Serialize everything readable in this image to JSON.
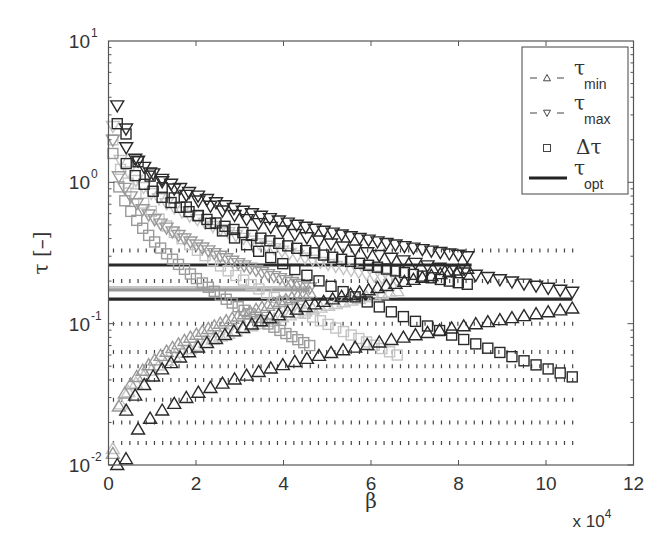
{
  "chart_data": {
    "type": "scatter",
    "title": "",
    "xlabel": "β",
    "ylabel": "τ [–]",
    "x_multiplier_label": "x 10",
    "x_multiplier_exp": "4",
    "xlim": [
      0,
      12
    ],
    "ylim": [
      0.01,
      10
    ],
    "yscale": "log",
    "grid": false,
    "x_ticks": [
      "0",
      "2",
      "4",
      "6",
      "8",
      "10",
      "12"
    ],
    "x_tick_values": [
      0,
      2,
      4,
      6,
      8,
      10,
      12
    ],
    "y_ticks": [
      {
        "base": "10",
        "exp": "1",
        "value": 10
      },
      {
        "base": "10",
        "exp": "0",
        "value": 1
      },
      {
        "base": "10",
        "exp": "-1",
        "value": 0.1
      },
      {
        "base": "10",
        "exp": "-2",
        "value": 0.01
      }
    ],
    "legend": {
      "position": "upper right",
      "entries": [
        {
          "label": "τ",
          "sub": "min",
          "marker": "triangle-up",
          "style": "dashed"
        },
        {
          "label": "τ",
          "sub": "max",
          "marker": "triangle-down",
          "style": "dashed"
        },
        {
          "label": "Δτ",
          "sub": "",
          "marker": "square",
          "style": "none"
        },
        {
          "label": "τ",
          "sub": "opt",
          "marker": "none",
          "style": "solid-thick"
        }
      ]
    },
    "series_groups": [
      {
        "name": "case A",
        "color": "#2a2a2a",
        "beta_start": 0.2,
        "beta_end": 8.2,
        "n_points": 40,
        "tau_max": {
          "start": 3.5,
          "end": 0.3,
          "curve": 0.35
        },
        "tau_min": {
          "start": 0.01,
          "end": 0.245,
          "curve": 0.35
        },
        "delta_tau": {
          "start": 2.6,
          "end": 0.19,
          "curve": 0.38
        },
        "tau_opt": 0.26,
        "opt_beta_end": 8.3,
        "dotted_levels": [
          0.33,
          0.2,
          0.1,
          0.063,
          0.05
        ]
      },
      {
        "name": "case B",
        "color": "#2a2a2a",
        "beta_start": 0.4,
        "beta_end": 10.6,
        "n_points": 38,
        "tau_max": {
          "start": 2.4,
          "end": 0.168,
          "curve": 0.45
        },
        "tau_min": {
          "start": 0.011,
          "end": 0.128,
          "curve": 0.45
        },
        "delta_tau": {
          "start": 2.2,
          "end": 0.042,
          "curve": 0.6
        },
        "tau_opt": 0.149,
        "opt_beta_end": 10.6,
        "dotted_levels": [
          0.04,
          0.029,
          0.02,
          0.0143
        ]
      },
      {
        "name": "case C",
        "color": "#9a9a9a",
        "beta_start": 0.1,
        "beta_end": 4.6,
        "n_points": 34,
        "tau_max": {
          "start": 2.0,
          "end": 0.18,
          "curve": 0.4
        },
        "tau_min": {
          "start": 0.012,
          "end": 0.165,
          "curve": 0.35
        },
        "delta_tau": {
          "start": 1.6,
          "end": 0.07,
          "curve": 0.5
        },
        "tau_opt": 0.173,
        "opt_beta_end": 4.6,
        "dotted_levels": []
      },
      {
        "name": "case D",
        "color": "#c4c4c4",
        "beta_start": 0.1,
        "beta_end": 6.6,
        "n_points": 38,
        "tau_max": {
          "start": 2.5,
          "end": 0.2,
          "curve": 0.42
        },
        "tau_min": {
          "start": 0.013,
          "end": 0.17,
          "curve": 0.35
        },
        "delta_tau": {
          "start": 2.0,
          "end": 0.06,
          "curve": 0.55
        },
        "tau_opt": 0.18,
        "opt_beta_end": 4.6,
        "dotted_levels": []
      }
    ],
    "dotted_xrange": [
      0.1,
      10.7
    ]
  }
}
